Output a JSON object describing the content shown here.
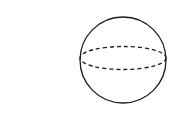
{
  "diagram": {
    "type": "sphere",
    "stroke_color": "#1a1a1a",
    "background": "#ffffff",
    "outline": {
      "cx": 123,
      "cy": 60,
      "r": 43
    },
    "equator": {
      "cx": 123,
      "cy": 58,
      "rx": 43,
      "ry": 11.5,
      "style": "dashed"
    }
  }
}
